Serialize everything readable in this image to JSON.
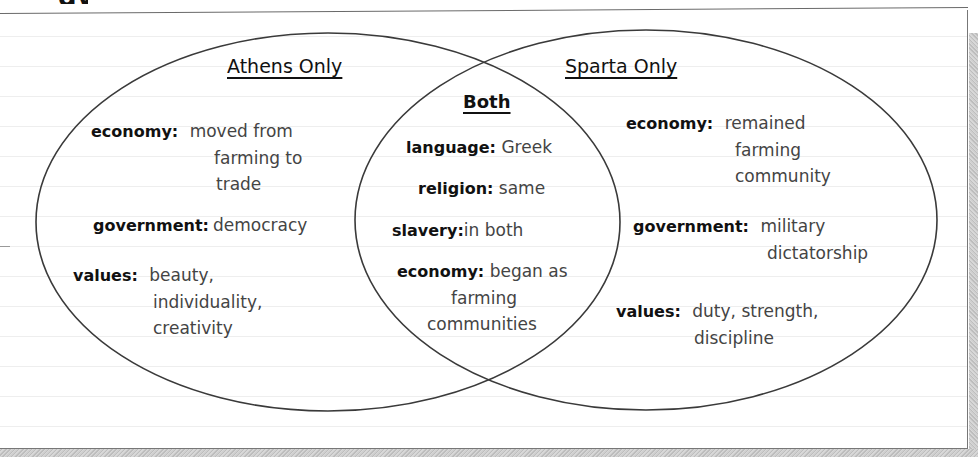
{
  "page": {
    "heading_fragment": "gy"
  },
  "diagram": {
    "type": "venn",
    "colors": {
      "outline": "#3a3a3a",
      "text_key": "#111111",
      "text_value": "#444444",
      "ruled_line": "#eeeeee",
      "shadow": "#c8c8c8"
    },
    "left": {
      "title": "Athens Only",
      "entries": [
        {
          "key": "economy:",
          "lines": [
            "moved from",
            "farming to",
            "trade"
          ]
        },
        {
          "key": "government:",
          "lines": [
            "democracy"
          ]
        },
        {
          "key": "values:",
          "lines": [
            "beauty,",
            "individuality,",
            "creativity"
          ]
        }
      ]
    },
    "center": {
      "title": "Both",
      "entries": [
        {
          "key": "language:",
          "lines": [
            "Greek"
          ]
        },
        {
          "key": "religion:",
          "lines": [
            "same"
          ]
        },
        {
          "key": "slavery:",
          "lines": [
            "in both"
          ]
        },
        {
          "key": "economy:",
          "lines": [
            "began as",
            "farming",
            "communities"
          ]
        }
      ]
    },
    "right": {
      "title": "Sparta Only",
      "entries": [
        {
          "key": "economy:",
          "lines": [
            "remained",
            "farming",
            "community"
          ]
        },
        {
          "key": "government:",
          "lines": [
            "military",
            "dictatorship"
          ]
        },
        {
          "key": "values:",
          "lines": [
            "duty, strength,",
            "discipline"
          ]
        }
      ]
    }
  }
}
